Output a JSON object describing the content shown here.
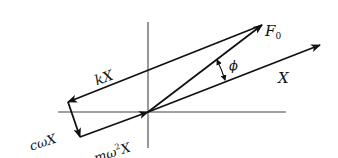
{
  "diagram": {
    "colors": {
      "ink": "#111111",
      "axis": "#444444",
      "background": "#ffffff"
    },
    "axes": {
      "horizontal": {
        "x1": 58,
        "y1": 112,
        "x2": 286,
        "y2": 112
      },
      "vertical": {
        "x1": 148,
        "y1": 22,
        "x2": 148,
        "y2": 148
      }
    },
    "vectors": [
      {
        "id": "X",
        "label": "X",
        "from": [
          148,
          112
        ],
        "to": [
          320,
          45
        ]
      },
      {
        "id": "F0",
        "label": "F₀",
        "from": [
          148,
          112
        ],
        "to": [
          262,
          25
        ]
      },
      {
        "id": "kX",
        "label": "kX",
        "from": [
          262,
          25
        ],
        "to": [
          68,
          102
        ]
      },
      {
        "id": "cwX",
        "label": "cωX",
        "from": [
          68,
          102
        ],
        "to": [
          80,
          137
        ]
      },
      {
        "id": "mw2X",
        "label": "mω²X",
        "from": [
          80,
          137
        ],
        "to": [
          148,
          112
        ]
      }
    ],
    "labels": {
      "F0": "F",
      "F0_sub": "0",
      "X": "X",
      "phi": "ϕ",
      "kX": "kX",
      "cwX": "cωX",
      "mw2X_m": "mω",
      "mw2X_sup": "2",
      "mw2X_X": "X"
    },
    "angle": {
      "name": "phi",
      "between": [
        "X",
        "F0"
      ]
    }
  }
}
